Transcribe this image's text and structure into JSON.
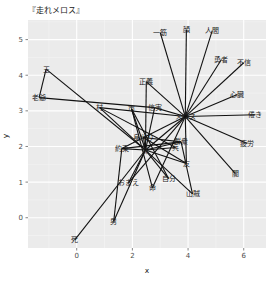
{
  "chart_data": {
    "type": "network",
    "title": "『走れメロス』",
    "xlabel": "x",
    "ylabel": "y",
    "xlim": [
      -1.75,
      6.8
    ],
    "ylim": [
      -0.85,
      5.55
    ],
    "xticks": [
      0,
      2,
      4,
      6
    ],
    "yticks": [
      0,
      1,
      2,
      3,
      4,
      5
    ],
    "grid": true,
    "legend": "none",
    "nodes": [
      {
        "id": "王",
        "x": -1.1,
        "y": 4.17
      },
      {
        "id": "老爺",
        "x": -1.35,
        "y": 3.37
      },
      {
        "id": "村",
        "x": 0.82,
        "y": 3.09
      },
      {
        "id": "市",
        "x": 1.97,
        "y": 3.06
      },
      {
        "id": "信実",
        "x": 2.8,
        "y": 3.09
      },
      {
        "id": "正義",
        "x": 2.5,
        "y": 3.82
      },
      {
        "id": "メロス",
        "x": 3.9,
        "y": 2.84
      },
      {
        "id": "一筋",
        "x": 3.0,
        "y": 5.2
      },
      {
        "id": "顔",
        "x": 3.94,
        "y": 5.28
      },
      {
        "id": "人間",
        "x": 4.87,
        "y": 5.25
      },
      {
        "id": "勇者",
        "x": 5.2,
        "y": 4.44
      },
      {
        "id": "不信",
        "x": 6.0,
        "y": 4.35
      },
      {
        "id": "心臓",
        "x": 5.77,
        "y": 3.46
      },
      {
        "id": "倦き",
        "x": 6.42,
        "y": 2.89
      },
      {
        "id": "疲労",
        "x": 6.13,
        "y": 2.08
      },
      {
        "id": "闇",
        "x": 5.7,
        "y": 1.24
      },
      {
        "id": "山賊",
        "x": 4.16,
        "y": 0.67
      },
      {
        "id": "友",
        "x": 3.94,
        "y": 1.52
      },
      {
        "id": "自分",
        "x": 3.3,
        "y": 1.1
      },
      {
        "id": "兵",
        "x": 3.55,
        "y": 1.97
      },
      {
        "id": "群衆",
        "x": 3.75,
        "y": 2.13
      },
      {
        "id": "命",
        "x": 2.72,
        "y": 0.84
      },
      {
        "id": "妹",
        "x": 2.47,
        "y": 1.9
      },
      {
        "id": "約束",
        "x": 1.62,
        "y": 1.94
      },
      {
        "id": "おまえ",
        "x": 1.86,
        "y": 0.98
      },
      {
        "id": "男",
        "x": 1.33,
        "y": -0.1
      },
      {
        "id": "死",
        "x": -0.07,
        "y": -0.62
      },
      {
        "id": "身代り",
        "x": 2.4,
        "y": 2.25
      }
    ],
    "edges": [
      [
        "王",
        "老爺"
      ],
      [
        "王",
        "妹"
      ],
      [
        "老爺",
        "信実"
      ],
      [
        "村",
        "妹"
      ],
      [
        "村",
        "兵"
      ],
      [
        "市",
        "妹"
      ],
      [
        "市",
        "命"
      ],
      [
        "信実",
        "メロス"
      ],
      [
        "信実",
        "妹"
      ],
      [
        "正義",
        "メロス"
      ],
      [
        "正義",
        "妹"
      ],
      [
        "メロス",
        "一筋"
      ],
      [
        "メロス",
        "顔"
      ],
      [
        "メロス",
        "人間"
      ],
      [
        "メロス",
        "勇者"
      ],
      [
        "メロス",
        "不信"
      ],
      [
        "メロス",
        "心臓"
      ],
      [
        "メロス",
        "倦き"
      ],
      [
        "メロス",
        "疲労"
      ],
      [
        "メロス",
        "闇"
      ],
      [
        "メロス",
        "妹"
      ],
      [
        "メロス",
        "友"
      ],
      [
        "メロス",
        "約束"
      ],
      [
        "メロス",
        "おまえ"
      ],
      [
        "メロス",
        "命"
      ],
      [
        "メロス",
        "村"
      ],
      [
        "妹",
        "山賊"
      ],
      [
        "妹",
        "友"
      ],
      [
        "妹",
        "自分"
      ],
      [
        "妹",
        "兵"
      ],
      [
        "妹",
        "群衆"
      ],
      [
        "妹",
        "約束"
      ],
      [
        "妹",
        "男"
      ],
      [
        "妹",
        "死"
      ],
      [
        "妹",
        "身代り"
      ],
      [
        "妹",
        "おまえ"
      ],
      [
        "身代り",
        "群衆"
      ],
      [
        "身代り",
        "友"
      ],
      [
        "約束",
        "群衆"
      ],
      [
        "約束",
        "男"
      ],
      [
        "群衆",
        "山賊"
      ],
      [
        "市",
        "自分"
      ]
    ]
  }
}
